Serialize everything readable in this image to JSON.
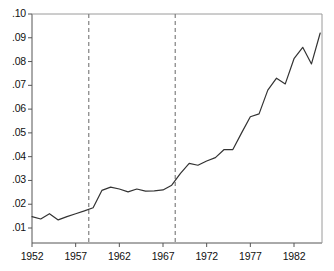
{
  "chart_data": {
    "type": "line",
    "title": "",
    "subtitle": "",
    "xlabel": "",
    "ylabel": "",
    "xlim": [
      1952,
      1985.5
    ],
    "ylim": [
      0.0,
      0.1
    ],
    "grid": false,
    "legend": "none",
    "line_color": "#333333",
    "axis_color": "#555555",
    "reference_line_color": "#808080",
    "x_ticks": [
      1952,
      1957,
      1962,
      1967,
      1972,
      1977,
      1982
    ],
    "x_tick_labels": [
      "1952",
      "1957",
      "1962",
      "1967",
      "1972",
      "1977",
      "1982"
    ],
    "y_ticks": [
      0.01,
      0.02,
      0.03,
      0.04,
      0.05,
      0.06,
      0.07,
      0.08,
      0.09,
      0.1
    ],
    "y_tick_labels": [
      ".01",
      ".02",
      ".03",
      ".04",
      ".05",
      ".06",
      ".07",
      ".08",
      ".09",
      ".10"
    ],
    "reference_lines": [
      {
        "x": 1958.5,
        "style": "dashed",
        "label": ""
      },
      {
        "x": 1968.4,
        "style": "dashed",
        "label": ""
      }
    ],
    "series": [
      {
        "name": "series-1",
        "x": [
          1952,
          1953,
          1954,
          1955,
          1956,
          1957,
          1958,
          1959,
          1960,
          1961,
          1962,
          1963,
          1964,
          1965,
          1966,
          1967,
          1968,
          1969,
          1970,
          1971,
          1972,
          1973,
          1974,
          1975,
          1976,
          1977,
          1978,
          1979,
          1980,
          1981,
          1982,
          1983,
          1984,
          1985
        ],
        "values": [
          0.0148,
          0.0138,
          0.016,
          0.0134,
          0.0148,
          0.016,
          0.0172,
          0.0185,
          0.0258,
          0.0272,
          0.0264,
          0.0252,
          0.0264,
          0.0255,
          0.0256,
          0.026,
          0.028,
          0.033,
          0.0372,
          0.0364,
          0.0382,
          0.0396,
          0.043,
          0.043,
          0.05,
          0.0568,
          0.058,
          0.068,
          0.073,
          0.0706,
          0.0812,
          0.086,
          0.079,
          0.092
        ]
      }
    ]
  }
}
